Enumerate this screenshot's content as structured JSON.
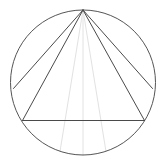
{
  "canvas": {
    "width": 165,
    "height": 164,
    "background_color": "#ffffff"
  },
  "figure": {
    "title": "Circle with inscribed triangle and apex chords",
    "circle": {
      "cx": 83,
      "cy": 82.5,
      "r": 72.5,
      "stroke_color": "#555555",
      "stroke_width": 1,
      "fill": "none"
    },
    "apex_point": {
      "x": 83,
      "y": 10
    },
    "strong_stroke_color": "#4a4a4a",
    "faint_stroke_color": "#e2e2e2",
    "strong_stroke_width": 1,
    "faint_stroke_width": 1,
    "chords_strong": [
      {
        "name": "apex-to-left-upper",
        "x1": 83,
        "y1": 10,
        "x2": 13.5,
        "y2": 88.5
      },
      {
        "name": "apex-to-left-base",
        "x1": 83,
        "y1": 10,
        "x2": 22.5,
        "y2": 120.5
      },
      {
        "name": "apex-to-right-base",
        "x1": 83,
        "y1": 10,
        "x2": 144.5,
        "y2": 120.5
      },
      {
        "name": "apex-to-right-upper",
        "x1": 83,
        "y1": 10,
        "x2": 152.5,
        "y2": 88.5
      }
    ],
    "base_line": {
      "name": "triangle-base",
      "x1": 22.5,
      "y1": 120.5,
      "x2": 144.5,
      "y2": 120.5
    },
    "chords_faint": [
      {
        "name": "apex-to-bottom-left-arc",
        "x1": 83,
        "y1": 10,
        "x2": 60.0,
        "y2": 151.5
      },
      {
        "name": "apex-to-bottom-center-arc",
        "x1": 83,
        "y1": 10,
        "x2": 83,
        "y2": 155
      },
      {
        "name": "apex-to-bottom-right-arc",
        "x1": 83,
        "y1": 10,
        "x2": 106.0,
        "y2": 151.5
      }
    ]
  }
}
